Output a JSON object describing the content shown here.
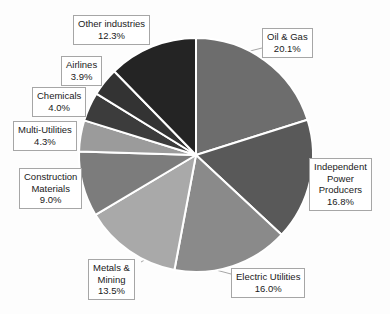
{
  "chart_data": {
    "type": "pie",
    "title": "",
    "subtitle": "",
    "xlabel": "",
    "ylabel": "",
    "legend_position": "callout-labels",
    "grid": false,
    "units": "percent",
    "start_angle_deg": 0,
    "direction": "clockwise",
    "categories": [
      "Oil & Gas",
      "Independent Power Producers",
      "Electric Utilities",
      "Metals & Mining",
      "Construction Materials",
      "Multi-Utilities",
      "Chemicals",
      "Airlines",
      "Other industries"
    ],
    "values": [
      20.1,
      16.8,
      16.0,
      13.5,
      9.0,
      4.3,
      4.0,
      3.9,
      12.3
    ],
    "colors": [
      "#6d6d6d",
      "#595959",
      "#8a8a8a",
      "#a9a9a9",
      "#7c7c7c",
      "#9b9b9b",
      "#3c3c3c",
      "#333333",
      "#242424"
    ],
    "slice_border_color": "#ffffff",
    "slice_border_width": 2,
    "slices": [
      {
        "label": "Oil & Gas",
        "value": 20.1,
        "value_text": "20.1%",
        "color": "#6d6d6d",
        "lines": [
          "Oil & Gas",
          "20.1%"
        ]
      },
      {
        "label": "Independent Power Producers",
        "value": 16.8,
        "value_text": "16.8%",
        "color": "#595959",
        "lines": [
          "Independent",
          "Power",
          "Producers",
          "16.8%"
        ]
      },
      {
        "label": "Electric Utilities",
        "value": 16.0,
        "value_text": "16.0%",
        "color": "#8a8a8a",
        "lines": [
          "Electric Utilities",
          "16.0%"
        ]
      },
      {
        "label": "Metals & Mining",
        "value": 13.5,
        "value_text": "13.5%",
        "color": "#a9a9a9",
        "lines": [
          "Metals &",
          "Mining",
          "13.5%"
        ]
      },
      {
        "label": "Construction Materials",
        "value": 9.0,
        "value_text": "9.0%",
        "color": "#7c7c7c",
        "lines": [
          "Construction",
          "Materials",
          "9.0%"
        ]
      },
      {
        "label": "Multi-Utilities",
        "value": 4.3,
        "value_text": "4.3%",
        "color": "#9b9b9b",
        "lines": [
          "Multi-Utilities",
          "4.3%"
        ]
      },
      {
        "label": "Chemicals",
        "value": 4.0,
        "value_text": "4.0%",
        "color": "#3c3c3c",
        "lines": [
          "Chemicals",
          "4.0%"
        ]
      },
      {
        "label": "Airlines",
        "value": 3.9,
        "value_text": "3.9%",
        "color": "#333333",
        "lines": [
          "Airlines",
          "3.9%"
        ]
      },
      {
        "label": "Other industries",
        "value": 12.3,
        "value_text": "12.3%",
        "color": "#242424",
        "lines": [
          "Other industries",
          "12.3%"
        ]
      }
    ]
  },
  "labels": {
    "oil_gas": {
      "line1": "Oil & Gas",
      "line2": "20.1%"
    },
    "ipp": {
      "line1": "Independent",
      "line2": "Power",
      "line3": "Producers",
      "line4": "16.8%"
    },
    "electric_utilities": {
      "line1": "Electric Utilities",
      "line2": "16.0%"
    },
    "metals_mining": {
      "line1": "Metals &",
      "line2": "Mining",
      "line3": "13.5%"
    },
    "construction_materials": {
      "line1": "Construction",
      "line2": "Materials",
      "line3": "9.0%"
    },
    "multi_utilities": {
      "line1": "Multi-Utilities",
      "line2": "4.3%"
    },
    "chemicals": {
      "line1": "Chemicals",
      "line2": "4.0%"
    },
    "airlines": {
      "line1": "Airlines",
      "line2": "3.9%"
    },
    "other_industries": {
      "line1": "Other industries",
      "line2": "12.3%"
    }
  }
}
